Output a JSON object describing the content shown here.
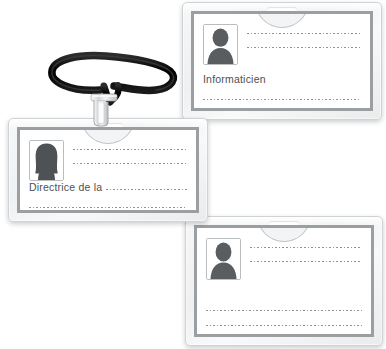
{
  "scene": {
    "title": "Badge holders with lanyard",
    "background_color": "#ffffff",
    "accent_color": "#9b9fa2",
    "line_color": "#8d9295",
    "lanyard_color": "#111111",
    "clip_color": "#d9dbdd"
  },
  "badges": [
    {
      "id": "badge-top",
      "name": "badge-top",
      "photo_icon": "person-silhouette-icon",
      "photo_gender": "male",
      "slot_label": "",
      "lines": [
        {
          "type": "dotted",
          "label": ""
        },
        {
          "type": "dotted",
          "label": ""
        },
        {
          "type": "text",
          "label": "Informaticien"
        },
        {
          "type": "dotted",
          "label": ""
        }
      ]
    },
    {
      "id": "badge-middle",
      "name": "badge-middle",
      "photo_icon": "person-silhouette-icon",
      "photo_gender": "female",
      "slot_label": "",
      "lines": [
        {
          "type": "dotted",
          "label": ""
        },
        {
          "type": "dotted",
          "label": ""
        },
        {
          "type": "text",
          "label": "Directrice de la"
        },
        {
          "type": "dotted",
          "label": ""
        }
      ]
    },
    {
      "id": "badge-bottom",
      "name": "badge-bottom",
      "photo_icon": "person-silhouette-icon",
      "photo_gender": "male",
      "slot_label": "",
      "lines": [
        {
          "type": "dotted",
          "label": ""
        },
        {
          "type": "dotted",
          "label": ""
        },
        {
          "type": "dotted",
          "label": ""
        },
        {
          "type": "dotted",
          "label": ""
        }
      ]
    }
  ],
  "lanyard": {
    "name": "lanyard-strap",
    "clip_name": "lanyard-clip",
    "color": "#111111"
  }
}
